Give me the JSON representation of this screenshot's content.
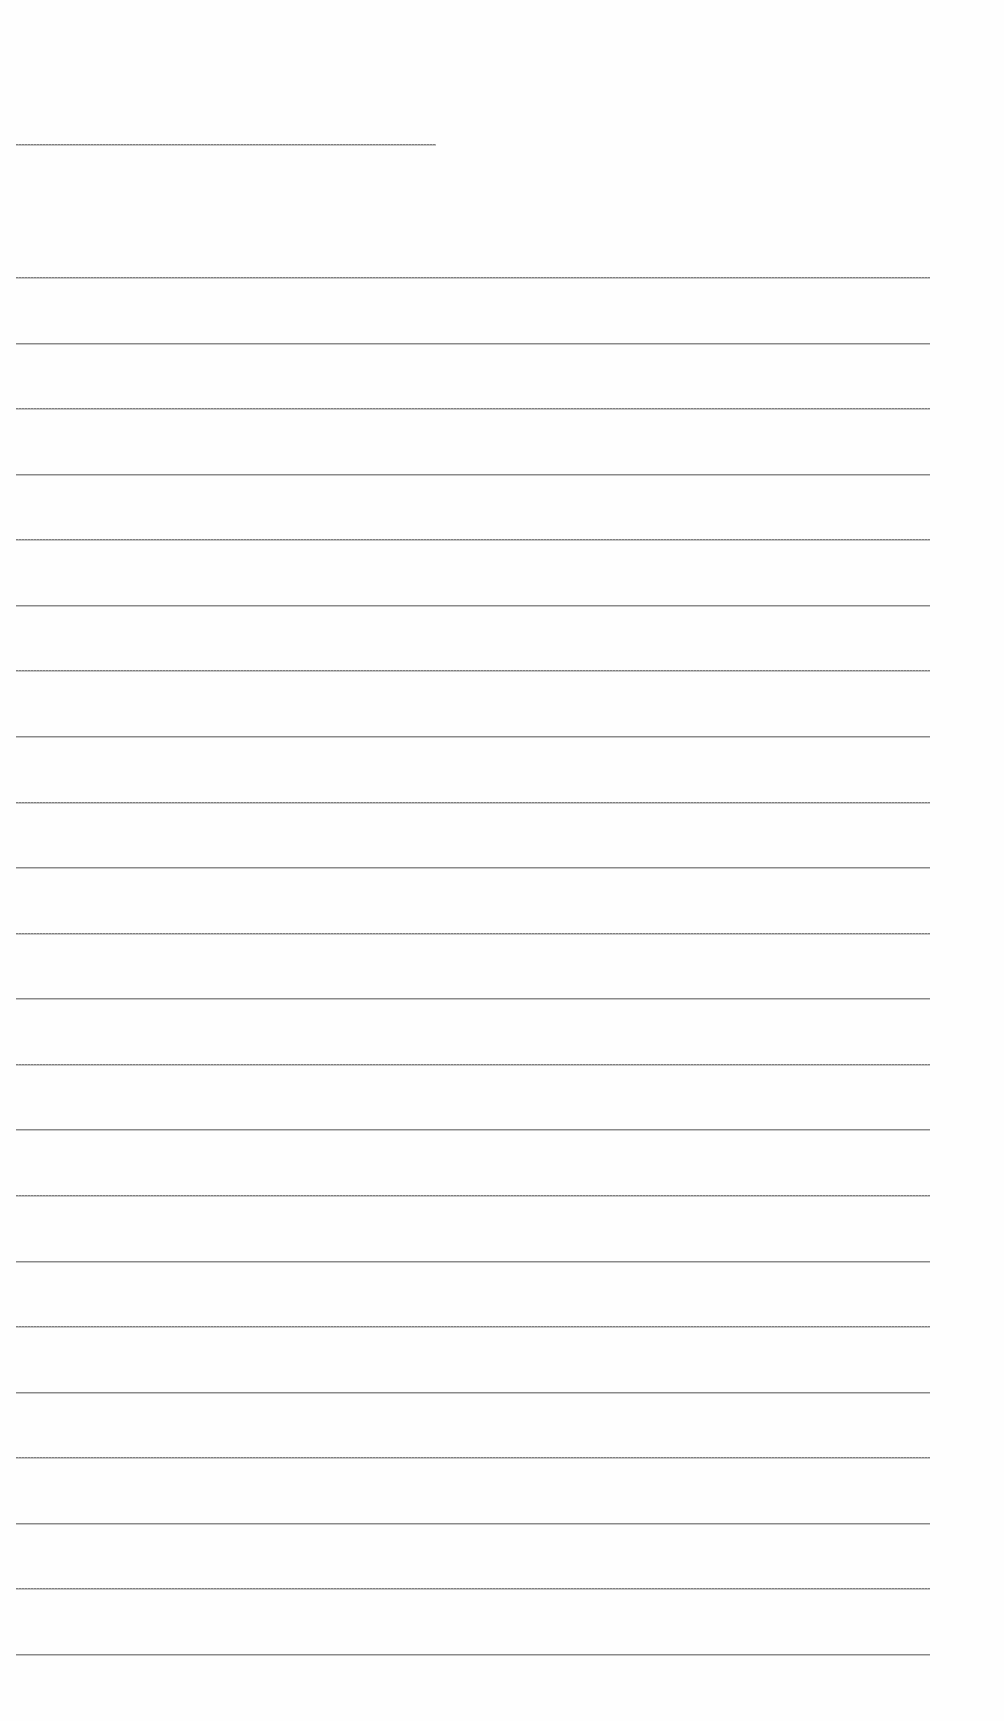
{
  "page": {
    "background": "#ffffff",
    "line_color": "#8a8a8a"
  },
  "heading_line": {
    "x": 16,
    "y": 144,
    "width": 420
  },
  "writing_lines": {
    "x": 16,
    "width": 914,
    "start_y": 277,
    "spacing": 65.57,
    "count": 22
  }
}
